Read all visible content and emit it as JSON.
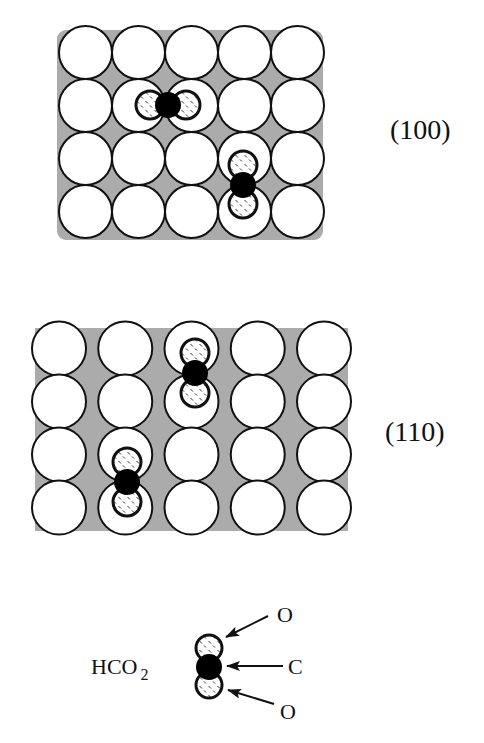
{
  "figure": {
    "colors": {
      "substrate_fill": "#ffffff",
      "substrate_stroke": "#111111",
      "surface_background": "#ababab",
      "carbon_fill": "#000000",
      "oxygen_fill": "#ffffff",
      "oxygen_stroke": "#111111"
    },
    "surfaces": [
      {
        "id": "100",
        "label": "(100)",
        "rows": 4,
        "cols": 5,
        "origin": {
          "x": 85.5,
          "y": 52.5
        },
        "pitch": {
          "x": 53,
          "y": 53
        },
        "atom_radius": 26.5,
        "background": {
          "x": 57,
          "y": 30,
          "width": 266,
          "height": 210,
          "radius": 9
        },
        "label_pos": {
          "x": 390,
          "y": 116
        },
        "adsorbates": [
          {
            "orientation": "horizontal",
            "O1": {
              "x": 150,
              "y": 105
            },
            "C": {
              "x": 168,
              "y": 105
            },
            "O2": {
              "x": 186,
              "y": 105
            }
          },
          {
            "orientation": "vertical",
            "O1": {
              "x": 243,
              "y": 165
            },
            "C": {
              "x": 243,
              "y": 185
            },
            "O2": {
              "x": 243,
              "y": 204
            }
          }
        ]
      },
      {
        "id": "110",
        "label": "(110)",
        "rows": 4,
        "cols": 5,
        "origin": {
          "x": 59,
          "y": 348.5
        },
        "pitch": {
          "x": 66.25,
          "y": 53
        },
        "atom_radius": 27,
        "background": {
          "x": 35,
          "y": 328,
          "width": 313,
          "height": 203,
          "radius": 0
        },
        "label_pos": {
          "x": 385,
          "y": 418
        },
        "adsorbates": [
          {
            "orientation": "vertical",
            "O1": {
              "x": 195,
              "y": 353
            },
            "C": {
              "x": 195,
              "y": 373
            },
            "O2": {
              "x": 195,
              "y": 393
            }
          },
          {
            "orientation": "vertical",
            "O1": {
              "x": 127,
              "y": 462
            },
            "C": {
              "x": 127,
              "y": 482
            },
            "O2": {
              "x": 127,
              "y": 502
            }
          }
        ]
      }
    ],
    "molecule_radii": {
      "O": 14,
      "C": 13
    },
    "legend": {
      "formula_main": "HCO",
      "formula_sub": "2",
      "formula_pos": {
        "x": 91,
        "y": 656
      },
      "molecule": {
        "O1": {
          "x": 209,
          "y": 648
        },
        "C": {
          "x": 209,
          "y": 667
        },
        "O2": {
          "x": 209,
          "y": 685
        },
        "r_O": 13,
        "r_C": 13
      },
      "callouts": [
        {
          "label": "O",
          "text_pos": {
            "x": 277,
            "y": 604
          },
          "arrow_from": {
            "x": 268,
            "y": 616
          },
          "arrow_to": {
            "x": 226,
            "y": 637
          }
        },
        {
          "label": "C",
          "text_pos": {
            "x": 288,
            "y": 656
          },
          "arrow_from": {
            "x": 283,
            "y": 666
          },
          "arrow_to": {
            "x": 227,
            "y": 666
          }
        },
        {
          "label": "O",
          "text_pos": {
            "x": 280,
            "y": 701
          },
          "arrow_from": {
            "x": 274,
            "y": 704
          },
          "arrow_to": {
            "x": 228,
            "y": 690
          }
        }
      ]
    }
  }
}
